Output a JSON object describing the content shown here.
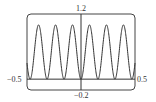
{
  "chart_data": {
    "type": "line",
    "title": "",
    "xlabel": "",
    "ylabel": "",
    "function": "y = sin^2(20x)",
    "xlim": [
      -0.5,
      0.5
    ],
    "ylim": [
      -0.2,
      1.2
    ],
    "grid": false,
    "legend": null,
    "frame": "rounded viewing window",
    "labels": {
      "y_max": "1.2",
      "y_min": "−0.2",
      "x_min": "−0.5",
      "x_max": "0.5"
    },
    "series": [
      {
        "name": "curve",
        "x": [
          -0.5,
          -0.471,
          -0.393,
          -0.314,
          -0.236,
          -0.157,
          -0.079,
          0,
          0.079,
          0.157,
          0.236,
          0.314,
          0.393,
          0.471,
          0.5
        ],
        "values": [
          0.296,
          0,
          1,
          0,
          1,
          0,
          1,
          0,
          1,
          0,
          1,
          0,
          1,
          0,
          0.296
        ]
      }
    ],
    "peaks": 6,
    "peak_value": 1,
    "trough_value": 0
  },
  "style": {
    "line_color": "#333333",
    "axis_color": "#333333",
    "frame_color": "#444444",
    "background": "#ffffff"
  }
}
